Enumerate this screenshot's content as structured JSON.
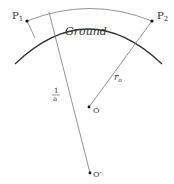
{
  "diagram": {
    "labels": {
      "p1": "P",
      "p1_sub": "1",
      "p2": "P",
      "p2_sub": "2",
      "ground": "Ground",
      "r0": "r",
      "r0_sub": "o",
      "o": "O",
      "o_prime": "O′",
      "frac_num": "1",
      "frac_den": "a"
    },
    "colors": {
      "line": "#555555",
      "ground": "#333333",
      "dot": "#111111"
    }
  }
}
